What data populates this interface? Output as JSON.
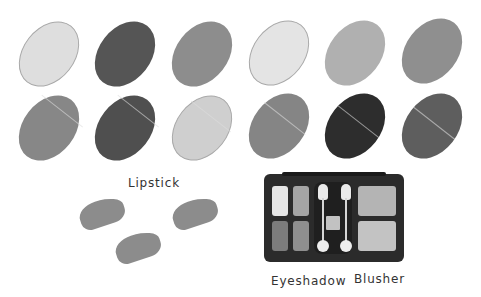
{
  "ovals": {
    "row1": [
      {
        "shade": "#dedede",
        "light": true
      },
      {
        "shade": "#555555",
        "light": false
      },
      {
        "shade": "#8d8d8d",
        "light": false
      },
      {
        "shade": "#e4e4e4",
        "light": true
      },
      {
        "shade": "#b0b0b0",
        "light": false
      },
      {
        "shade": "#8f8f8f",
        "light": false
      }
    ],
    "row2": [
      {
        "shade": "#878787",
        "light": false
      },
      {
        "shade": "#4f4f4f",
        "light": false
      },
      {
        "shade": "#cfcfcf",
        "light": true
      },
      {
        "shade": "#858585",
        "light": false
      },
      {
        "shade": "#2d2d2d",
        "light": false
      },
      {
        "shade": "#5e5e5e",
        "light": false
      }
    ]
  },
  "lipstick": {
    "label": "Lipstick",
    "color": "#8c8c8c"
  },
  "compact": {
    "eyeshadow_label": "Eyeshadow",
    "blusher_label": "Blusher",
    "eyeshadow_pans": [
      "#e6e6e6",
      "#a5a5a5",
      "#7c7c7c",
      "#8f8f8f"
    ],
    "blusher_pans": [
      "#b4b4b4",
      "#c3c3c3"
    ],
    "center_pan": "#c2c2c2"
  }
}
